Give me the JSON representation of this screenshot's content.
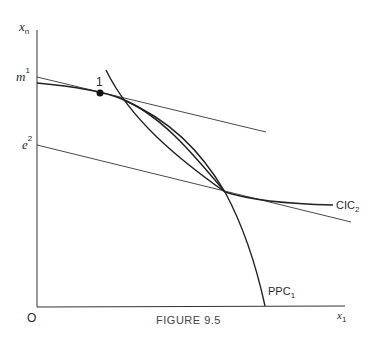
{
  "figure": {
    "caption": "FIGURE 9.5",
    "axes": {
      "y_label": "x",
      "y_sub": "n",
      "x_label": "x",
      "x_sub": "1",
      "origin": "O"
    },
    "y_ticks": [
      {
        "label": "m",
        "sup": "1"
      },
      {
        "label": "e",
        "sup": "2"
      }
    ],
    "point_label": "1",
    "curves": {
      "cic_label": "CIC",
      "cic_sub": "2",
      "ppc_label": "PPC",
      "ppc_sub": "1"
    },
    "colors": {
      "line": "#2a2a2a",
      "background": "#ffffff"
    }
  }
}
